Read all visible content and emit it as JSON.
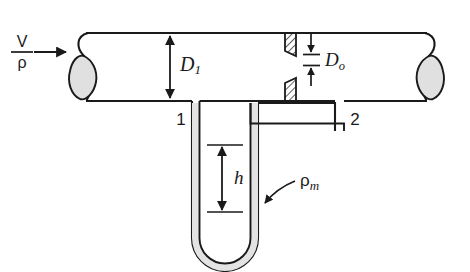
{
  "figure": {
    "background_color": "#ffffff",
    "line_color": "#1a1a1a",
    "fluid_fill_color": "#e3e3e3",
    "pipe_end_fill_color": "#e0e0e0",
    "hatch_color": "#1a1a1a"
  },
  "labels": {
    "velocity": "V",
    "density": "ρ",
    "pipe_diameter": "D",
    "pipe_diameter_sub": "1",
    "orifice_diameter": "D",
    "orifice_diameter_sub": "o",
    "tap_one": "1",
    "tap_two": "2",
    "manometer_height": "h",
    "manometer_density": "ρ",
    "manometer_density_sub": "m"
  },
  "elements": {
    "inlet_arrow": "inlet-flow-arrow",
    "fraction_bar": "velocity-density-fraction-bar",
    "pipe": "horizontal-pipe",
    "left_pipe_end": "left-pipe-cutaway-end",
    "right_pipe_end": "right-pipe-cutaway-end",
    "orifice_plate_top": "orifice-plate-upper-segment",
    "orifice_plate_bottom": "orifice-plate-lower-segment",
    "d1_dimension": "pipe-diameter-dimension-arrow",
    "do_dimension": "orifice-diameter-dimension-arrow",
    "h_dimension": "manometer-height-dimension-arrow",
    "manometer": "u-tube-manometer",
    "leader": "manometer-fluid-leader-arrow"
  }
}
